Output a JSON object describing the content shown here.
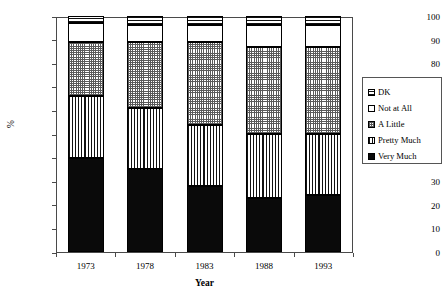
{
  "chart_data": {
    "type": "bar",
    "subtype": "stacked-bar-100-percent",
    "title": "",
    "xlabel": "Year",
    "ylabel": "%",
    "categories": [
      "1973",
      "1978",
      "1983",
      "1988",
      "1993"
    ],
    "ylim": [
      0,
      100
    ],
    "yticks": [
      0,
      10,
      20,
      30,
      40,
      50,
      60,
      70,
      80,
      90,
      100
    ],
    "ytick_labels": [
      "0",
      "10",
      "20",
      "30",
      "40",
      "50",
      "60",
      "70",
      "80",
      "90",
      "100"
    ],
    "grid": false,
    "legend_position": "right",
    "stack_order_bottom_to_top": [
      "Very Much",
      "Pretty Much",
      "A Little",
      "Not at All",
      "DK"
    ],
    "series": [
      {
        "name": "Very Much",
        "pattern": "solid-black",
        "values": [
          40,
          35,
          28,
          23,
          24
        ]
      },
      {
        "name": "Pretty Much",
        "pattern": "vertical-lines",
        "values": [
          26,
          26,
          26,
          27,
          26
        ]
      },
      {
        "name": "A Little",
        "pattern": "crosshatch-grey",
        "values": [
          23,
          28,
          35,
          37,
          37
        ]
      },
      {
        "name": "Not at All",
        "pattern": "white-empty",
        "values": [
          8,
          7,
          7,
          9,
          9
        ]
      },
      {
        "name": "DK",
        "pattern": "horizontal-lines",
        "values": [
          3,
          4,
          4,
          4,
          4
        ]
      }
    ],
    "cumulative_tops": {
      "1973": [
        40,
        66,
        89,
        97,
        100
      ],
      "1978": [
        35,
        61,
        89,
        96,
        100
      ],
      "1983": [
        28,
        54,
        89,
        96,
        100
      ],
      "1988": [
        23,
        50,
        87,
        96,
        100
      ],
      "1993": [
        24,
        50,
        87,
        96,
        100
      ]
    }
  },
  "axes": {
    "y_title": "%",
    "x_title": "Year"
  },
  "legend": {
    "items": [
      {
        "label": "DK"
      },
      {
        "label": "Not at All"
      },
      {
        "label": "A Little"
      },
      {
        "label": "Pretty Much"
      },
      {
        "label": "Very Much"
      }
    ]
  }
}
